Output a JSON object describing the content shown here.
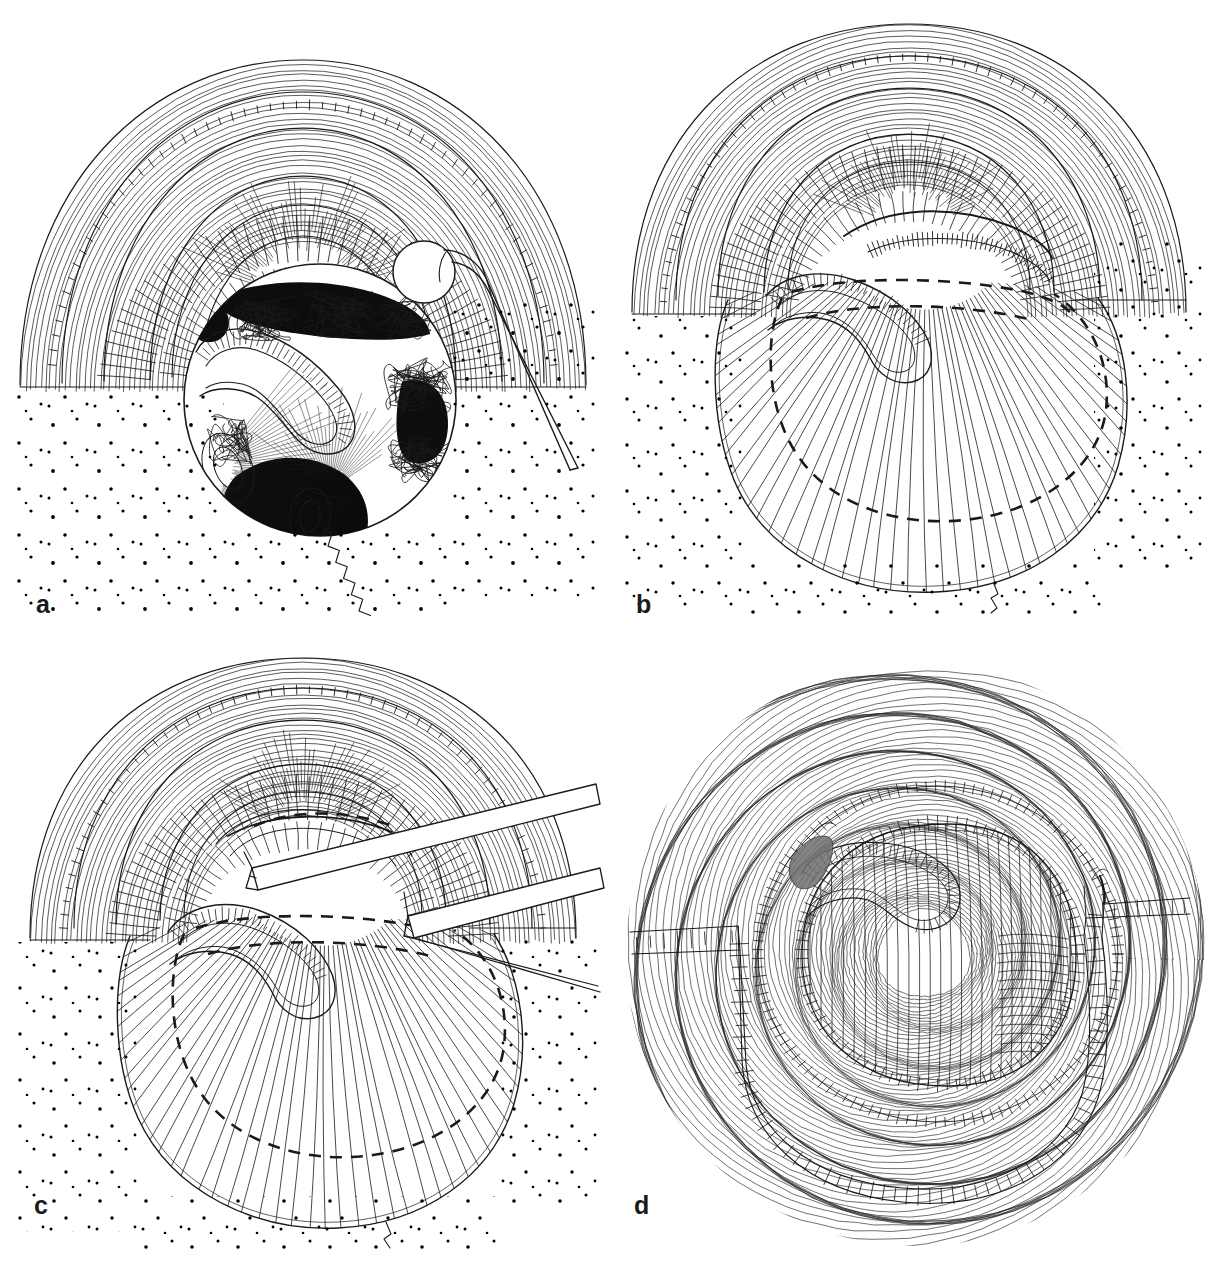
{
  "figure": {
    "medium": "pen-and-ink line drawing",
    "background_color": "#ffffff",
    "ink_color": "#1a1a1a",
    "width_px": 1212,
    "height_px": 1271,
    "panel_grid": {
      "columns": 2,
      "rows": 2
    }
  },
  "panels": [
    {
      "id": "a",
      "label": "a",
      "position": "top-left",
      "caption_text": "",
      "description": "Cross-sectional operative view. Layered abdominal wall tissues drawn with fine parallel hatching arch over a circular defect. Inside the round opening, stippled and scribbled loops of bowel/omentum are visible against solid black shadowed regions. A round-jawed grasping forceps enters from the upper right and clamps a circular structure at the rim. A zigzag suture thread trails out of the bottom of the defect. Scattered stipple dots fill the surrounding surgical drape field.",
      "elements": [
        {
          "name": "layered-tissue-arch",
          "kind": "anatomy"
        },
        {
          "name": "circular-defect-opening",
          "kind": "anatomy"
        },
        {
          "name": "bowel-loops-scribble",
          "kind": "anatomy"
        },
        {
          "name": "black-shadow-region",
          "kind": "shading"
        },
        {
          "name": "grasping-forceps",
          "kind": "instrument"
        },
        {
          "name": "round-clamped-structure",
          "kind": "anatomy"
        },
        {
          "name": "zigzag-suture-thread",
          "kind": "suture"
        },
        {
          "name": "stipple-field",
          "kind": "texture"
        }
      ]
    },
    {
      "id": "b",
      "label": "b",
      "position": "top-right",
      "caption_text": "",
      "description": "Same layered tissue arch with the defect now covered. A large fan-hatched flap or mesh sheet spreads downward over the opening, its buried margin traced by a heavy dashed line forming a broad oval. A rounded hook-shaped band with serrated upper edge passes under the arch. Stipple dots surround the field.",
      "elements": [
        {
          "name": "layered-tissue-arch",
          "kind": "anatomy"
        },
        {
          "name": "fan-hatched-mesh-flap",
          "kind": "implant"
        },
        {
          "name": "dashed-mesh-outline",
          "kind": "annotation"
        },
        {
          "name": "hook-shaped-band",
          "kind": "anatomy"
        },
        {
          "name": "serrated-edge-band",
          "kind": "anatomy"
        },
        {
          "name": "stipple-field",
          "kind": "texture"
        }
      ]
    },
    {
      "id": "c",
      "label": "c",
      "position": "bottom-left",
      "caption_text": "",
      "description": "Same view as panel b with two flat-bladed retractor instruments introduced diagonally from the upper right. The upper blade lifts the tissue arch while the lower blade slides beneath the mesh margin. The dashed outline of the buried mesh and the fan-hatched flap remain visible below.",
      "elements": [
        {
          "name": "layered-tissue-arch",
          "kind": "anatomy"
        },
        {
          "name": "fan-hatched-mesh-flap",
          "kind": "implant"
        },
        {
          "name": "dashed-mesh-outline",
          "kind": "annotation"
        },
        {
          "name": "upper-retractor-blade",
          "kind": "instrument"
        },
        {
          "name": "lower-retractor-blade",
          "kind": "instrument"
        },
        {
          "name": "hook-shaped-band",
          "kind": "anatomy"
        },
        {
          "name": "stipple-field",
          "kind": "texture"
        }
      ]
    },
    {
      "id": "d",
      "label": "d",
      "position": "bottom-right",
      "caption_text": "",
      "description": "En-face (top-down) completed view. Concentric rings of fine contour hatching fill the full circular field. A central oval with tick-marked rim contains an S-shaped hooked band. Two stapled or sutured closure lines with ladder-like cross ticks run from the left and right edges and curve around the lower circumference. A small dark shaded wedge sits at the upper left of the central oval.",
      "elements": [
        {
          "name": "concentric-contour-field",
          "kind": "anatomy"
        },
        {
          "name": "central-oval-repair",
          "kind": "anatomy"
        },
        {
          "name": "s-shaped-hooked-band",
          "kind": "anatomy"
        },
        {
          "name": "left-closure-line",
          "kind": "suture"
        },
        {
          "name": "right-closure-line",
          "kind": "suture"
        },
        {
          "name": "lower-arc-staple-line",
          "kind": "suture"
        },
        {
          "name": "dark-wedge-shadow",
          "kind": "shading"
        }
      ]
    }
  ]
}
